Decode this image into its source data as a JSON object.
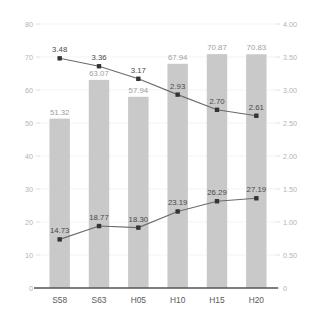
{
  "chart_data": {
    "type": "bar",
    "title": "",
    "subtitle": "",
    "xlabel": "",
    "ylabel": "",
    "categories": [
      "S58",
      "S63",
      "H05",
      "H10",
      "H15",
      "H20"
    ],
    "grid": true,
    "legend_position": "none",
    "axes": {
      "left": {
        "ylim": [
          0,
          80
        ],
        "tick_step": 10,
        "ticks": [
          "0",
          "10",
          "20",
          "30",
          "40",
          "50",
          "60",
          "70",
          "80"
        ]
      },
      "right": {
        "ylim": [
          0,
          4.0
        ],
        "tick_step": 0.5,
        "ticks": [
          "0",
          "0.50",
          "1.00",
          "1.50",
          "2.00",
          "2.50",
          "3.00",
          "3.50",
          "4.00"
        ]
      }
    },
    "series": [
      {
        "name": "bars",
        "type": "bar",
        "axis": "left",
        "color": "#c9c9c9",
        "values": [
          51.32,
          63.07,
          57.94,
          67.94,
          70.87,
          70.83
        ],
        "labels": [
          "51.32",
          "63.07",
          "57.94",
          "67.94",
          "70.87",
          "70.83"
        ]
      },
      {
        "name": "line-upper",
        "type": "line",
        "axis": "right",
        "color": "#6b6b6b",
        "marker_color": "#333333",
        "values": [
          3.48,
          3.36,
          3.17,
          2.93,
          2.7,
          2.61
        ],
        "labels": [
          "3.48",
          "3.36",
          "3.17",
          "2.93",
          "2.70",
          "2.61"
        ]
      },
      {
        "name": "line-lower",
        "type": "line",
        "axis": "left",
        "color": "#6b6b6b",
        "marker_color": "#333333",
        "values": [
          14.73,
          18.77,
          18.3,
          23.19,
          26.29,
          27.19
        ],
        "labels": [
          "14.73",
          "18.77",
          "18.30",
          "23.19",
          "26.29",
          "27.19"
        ]
      }
    ]
  },
  "colors": {
    "bar": "#c9c9c9",
    "line": "#6b6b6b",
    "marker": "#333333",
    "grid": "#f0f0f0",
    "axis": "#555555",
    "tick_text": "#b3b3b3",
    "category_text": "#5a5a5a",
    "bar_label_text": "#9e9e9e",
    "line_label_text": "#4a4a4a",
    "background": "#ffffff"
  }
}
